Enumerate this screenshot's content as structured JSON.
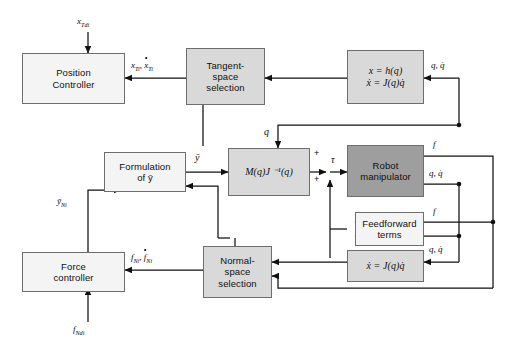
{
  "diagram": {
    "colors": {
      "background": "#ffffff",
      "line": "#111111",
      "block_border": "#6e6e6e",
      "block_light": "#f4f4f4",
      "block_mid": "#d9d9d9",
      "block_dark": "#9e9e9e"
    }
  },
  "blocks": [
    {
      "id": "position-controller",
      "lines": [
        "Position",
        "Controller"
      ],
      "shade": "light"
    },
    {
      "id": "tangent-space-selection",
      "lines": [
        "Tangent-",
        "space",
        "selection"
      ],
      "shade": "mid"
    },
    {
      "id": "forward-kinematics",
      "lines": [
        "x = h(q)",
        "ẋ = J(q)q̇"
      ],
      "shade": "mid"
    },
    {
      "id": "formulation-of-ybar",
      "lines": [
        "Formulation",
        "of ȳ"
      ],
      "shade": "light"
    },
    {
      "id": "inertia-jacobian",
      "lines": [
        "M(q)J ⁻¹(q)"
      ],
      "shade": "mid"
    },
    {
      "id": "robot-manipulator",
      "lines": [
        "Robot",
        "manipulator"
      ],
      "shade": "dark"
    },
    {
      "id": "feedforward-terms",
      "lines": [
        "Feedforward",
        "terms"
      ],
      "shade": "light"
    },
    {
      "id": "differential-kinematics",
      "lines": [
        "ẋ = J(q)q̇"
      ],
      "shade": "mid"
    },
    {
      "id": "normal-space-selection",
      "lines": [
        "Normal-",
        "space",
        "selection"
      ],
      "shade": "mid"
    },
    {
      "id": "force-controller",
      "lines": [
        "Force",
        "controller"
      ],
      "shade": "light"
    }
  ],
  "signals": {
    "x_Tdi": "x",
    "x_Tdi_sub": "Tdi",
    "x_Ti": "x",
    "x_Ti_sub": "Ti",
    "xdot_Ti": "x",
    "xdot_Ti_sub": "Ti",
    "q_qdot": "q, q̇",
    "q": "q",
    "ybar": "ȳ",
    "ybar_Ni": "ȳ",
    "ybar_Ni_sub": "Ni",
    "tau": "τ",
    "f": "f",
    "f_Ni": "f",
    "f_Ni_sub": "Ni",
    "fdot_Ni": "f",
    "fdot_Ni_sub": "Ni",
    "f_Ndi": "f",
    "f_Ndi_sub": "Ndi",
    "plus": "+",
    "comma": ","
  },
  "labels": {
    "x_Tdi_full": "x_Tdi",
    "x_Ti_pair": "x_Ti, ẋ_Ti",
    "q_qdot_top": "q, q̇",
    "q_mid": "q",
    "ybar_mid": "ȳ",
    "tau_mid": "τ",
    "f_top": "f",
    "q_qdot_robot": "q, q̇",
    "f_feedforward": "f",
    "q_qdot_feedforward": "q, q̇",
    "q_qdot_diffkin": "q, q̇",
    "f_Ni_pair": "f_Ni, ḟ_Ni",
    "f_Ndi_full": "f_Ndi",
    "ybar_Ni_full": "ȳ_Ni",
    "sum_plus_upper": "+",
    "sum_plus_lower": "+"
  }
}
